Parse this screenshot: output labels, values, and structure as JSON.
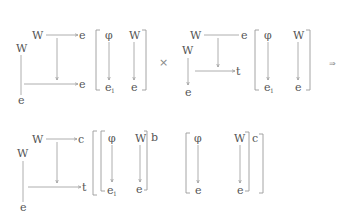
{
  "diagrams": [
    {
      "id": "top-left",
      "square": {
        "top_source": "W",
        "top_target": "e",
        "left_source": "W",
        "left_target": "e",
        "bottom_target": "e"
      },
      "matrix": {
        "col1_top": "φ",
        "col1_bottom": "e",
        "col1_bottom_sub": "1",
        "col2_top": "W",
        "col2_bottom": "e"
      }
    },
    {
      "id": "top-right",
      "square": {
        "top_source": "W",
        "top_target": "e",
        "left_source": "W",
        "left_target": "e",
        "bottom_target": "t"
      },
      "matrix": {
        "col1_top": "φ",
        "col1_bottom": "e",
        "col1_bottom_sub": "1",
        "col2_top": "W",
        "col2_bottom": "e"
      }
    },
    {
      "id": "bottom-left",
      "square": {
        "top_source": "W",
        "top_target": "c",
        "left_source": "W",
        "left_target": "e",
        "bottom_target": "t"
      },
      "matrix": {
        "col1_top": "φ",
        "col1_bottom": "e",
        "col1_bottom_sub": "1",
        "col2_top": "W",
        "col2_bottom": "e",
        "bracket_label": "b"
      }
    },
    {
      "id": "bottom-right",
      "matrix": {
        "col1_top": "φ",
        "col1_bottom": "e",
        "col2_top": "W",
        "col2_bottom": "e",
        "bracket_label": "c"
      }
    }
  ],
  "operators": {
    "product": "×",
    "implies": "⇒"
  }
}
